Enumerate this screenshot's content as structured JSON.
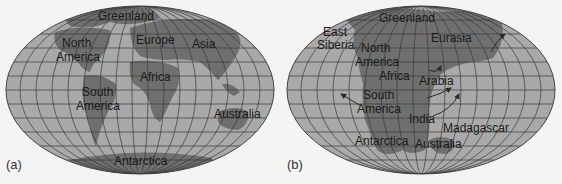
{
  "colors": {
    "ocean": "#a9a9a9",
    "land": "#6f6f6f",
    "grid": "#3a3a3a",
    "background": "#f4f4f4",
    "text": "#1a1a1a"
  },
  "panels": [
    {
      "tag": "(a)",
      "labels": {
        "greenland": "Greenland",
        "north1": "North",
        "north2": "America",
        "europe": "Europe",
        "asia": "Asia",
        "africa": "Africa",
        "south1": "South",
        "south2": "America",
        "australia": "Australia",
        "antarctica": "Antarctica"
      }
    },
    {
      "tag": "(b)",
      "labels": {
        "east": "East",
        "siberia": "Siberia",
        "greenland": "Greenland",
        "north1": "North",
        "north2": "America",
        "eurasia": "Eurasia",
        "africa": "Africa",
        "arabia": "Arabia",
        "south1": "South",
        "south2": "America",
        "india": "India",
        "madagascar": "Madagascar",
        "antarctica": "Antarctica",
        "australia": "Australia"
      }
    }
  ]
}
